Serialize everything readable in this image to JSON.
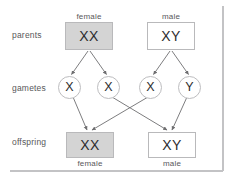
{
  "diagram": {
    "row_labels": [
      {
        "id": "parents",
        "text": "parents"
      },
      {
        "id": "gametes",
        "text": "gametes"
      },
      {
        "id": "offspring",
        "text": "offspring"
      }
    ],
    "parents": [
      {
        "id": "mother",
        "sex_label": "female",
        "genotype": "XX",
        "shaded": true
      },
      {
        "id": "father",
        "sex_label": "male",
        "genotype": "XY",
        "shaded": false
      }
    ],
    "gametes": [
      {
        "id": "egg-x-1",
        "allele": "X",
        "from": "mother"
      },
      {
        "id": "egg-x-2",
        "allele": "X",
        "from": "mother"
      },
      {
        "id": "sperm-x",
        "allele": "X",
        "from": "father"
      },
      {
        "id": "sperm-y",
        "allele": "Y",
        "from": "father"
      }
    ],
    "offspring": [
      {
        "id": "daughter",
        "genotype": "XX",
        "sex_label": "female",
        "shaded": true
      },
      {
        "id": "son",
        "genotype": "XY",
        "sex_label": "male",
        "shaded": false
      }
    ],
    "colors": {
      "shaded_fill": "#d4d4d4",
      "plain_fill": "#ffffff",
      "box_border": "#b9b9bb",
      "circle_border": "#bdbdbf",
      "arrow": "#6e6e70",
      "text": "#2d2d2f",
      "label_text": "#58585a",
      "frame_line": "#c3c3c5"
    }
  }
}
